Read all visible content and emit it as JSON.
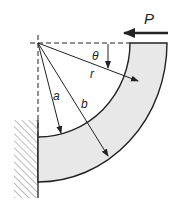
{
  "diagram": {
    "labels": {
      "force": "P",
      "angle": "θ",
      "radius": "r",
      "inner_radius": "a",
      "outer_radius": "b"
    },
    "colors": {
      "beam_fill": "#e8e8e8",
      "stroke": "#222222",
      "background": "#ffffff"
    },
    "geometry": {
      "center": [
        38,
        43
      ],
      "inner_radius_px": 94,
      "outer_radius_px": 134
    }
  }
}
